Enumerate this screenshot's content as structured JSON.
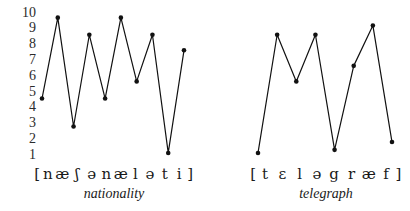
{
  "figure": {
    "background_color": "#ffffff",
    "ink_color": "#111111",
    "y_axis": {
      "ticks": [
        "10",
        "9",
        "8",
        "7",
        "6",
        "5",
        "4",
        "3",
        "2",
        "1"
      ],
      "min": 1,
      "max": 10
    }
  },
  "chart_data": [
    {
      "type": "line",
      "title": "nationality",
      "xlabel": "[ n æ ʃ ə n æ l ə t i ]",
      "ylabel": "",
      "ylim": [
        0.6,
        10.2
      ],
      "grid": false,
      "legend": "none",
      "word": "nationality",
      "bracket_open": "[",
      "bracket_close": "]",
      "categories": [
        "n",
        "æ",
        "ʃ",
        "ə",
        "n",
        "æ",
        "l",
        "ə",
        "t",
        "i"
      ],
      "values": [
        4.5,
        9.7,
        2.7,
        8.6,
        4.5,
        9.7,
        5.6,
        8.6,
        1.0,
        7.6
      ],
      "markers": "filled-circle"
    },
    {
      "type": "line",
      "title": "telegraph",
      "xlabel": "[ t ɛ l ə g r æ f ]",
      "ylabel": "",
      "ylim": [
        0.6,
        10.2
      ],
      "grid": false,
      "legend": "none",
      "word": "telegraph",
      "bracket_open": "[",
      "bracket_close": "]",
      "categories": [
        "t",
        "ɛ",
        "l",
        "ə",
        "g",
        "r",
        "æ",
        "f"
      ],
      "values": [
        1.0,
        8.6,
        5.6,
        8.6,
        1.2,
        6.6,
        9.2,
        1.7
      ],
      "markers": "filled-circle"
    }
  ]
}
